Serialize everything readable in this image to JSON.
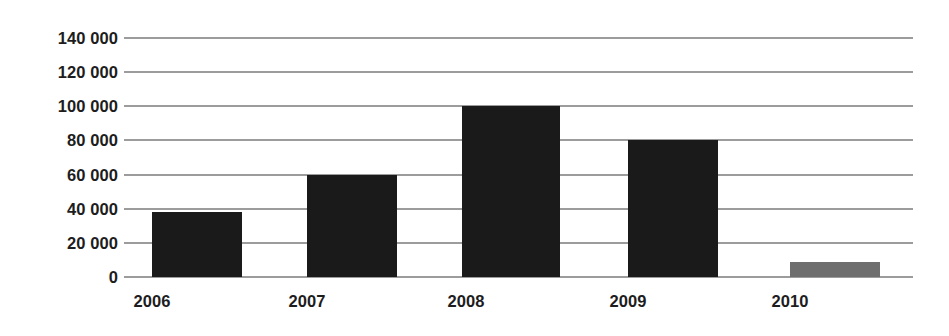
{
  "chart_data": {
    "type": "bar",
    "title": "",
    "subtitle": "",
    "xlabel": "",
    "ylabel": "",
    "categories": [
      "2006",
      "2007",
      "2008",
      "2009",
      "2010"
    ],
    "values": [
      38000,
      60000,
      100000,
      80000,
      9000
    ],
    "series": [
      {
        "name": "",
        "values": [
          38000,
          60000,
          100000,
          80000,
          9000
        ]
      }
    ],
    "bar_colors": [
      "#1a1a1a",
      "#1a1a1a",
      "#1a1a1a",
      "#1a1a1a",
      "#6e6e6e"
    ],
    "ylim": [
      0,
      140000
    ],
    "ytick_step": 20000,
    "ytick_labels": [
      "140 000",
      "120 000",
      "100 000",
      "80 000",
      "60 000",
      "40 000",
      "20 000",
      "0"
    ],
    "ytick_values": [
      140000,
      120000,
      100000,
      80000,
      60000,
      40000,
      20000,
      0
    ],
    "grid": true,
    "grid_axis": "y",
    "grid_color": "#3b3b3b",
    "legend": false,
    "legend_position": "none",
    "background_color": "#ffffff",
    "axis_line": false,
    "annotations": []
  },
  "axes": {
    "y": {
      "ticks": [
        {
          "label": "140 000",
          "value": 140000
        },
        {
          "label": "120 000",
          "value": 120000
        },
        {
          "label": "100 000",
          "value": 100000
        },
        {
          "label": "80 000",
          "value": 80000
        },
        {
          "label": "60 000",
          "value": 60000
        },
        {
          "label": "40 000",
          "value": 40000
        },
        {
          "label": "20 000",
          "value": 20000
        },
        {
          "label": "0",
          "value": 0
        }
      ]
    },
    "x": {
      "ticks": [
        {
          "label": "2006"
        },
        {
          "label": "2007"
        },
        {
          "label": "2008"
        },
        {
          "label": "2009"
        },
        {
          "label": "2010"
        }
      ]
    }
  },
  "bars": [
    {
      "category": "2006",
      "value": 38000,
      "color": "#1a1a1a"
    },
    {
      "category": "2007",
      "value": 60000,
      "color": "#1a1a1a"
    },
    {
      "category": "2008",
      "value": 100000,
      "color": "#1a1a1a"
    },
    {
      "category": "2009",
      "value": 80000,
      "color": "#1a1a1a"
    },
    {
      "category": "2010",
      "value": 9000,
      "color": "#6e6e6e"
    }
  ]
}
